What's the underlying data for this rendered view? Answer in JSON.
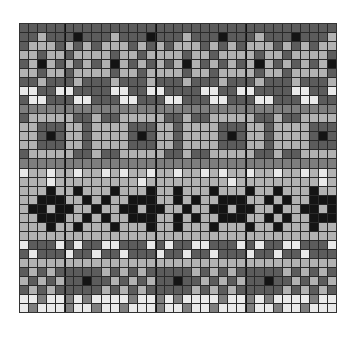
{
  "chart": {
    "title": "",
    "columns": 35,
    "rows": 32,
    "palette": {
      "D": "#5c5c5c",
      "M": "#7e7e7e",
      "L": "#b2b2b2",
      "W": "#e9e9e9",
      "B": "#141414"
    },
    "thick_line_every": 10,
    "thick_line_offset": 5,
    "pattern_rows": [
      {
        "period": "D",
        "offset": 0
      },
      {
        "period": "DDLDDDBD",
        "offset": 0
      },
      {
        "period": "DLLLDLDL",
        "offset": 0
      },
      {
        "period": "LLDLLDLL",
        "offset": 0
      },
      {
        "period": "DLBLDLDL",
        "offset": 0
      },
      {
        "period": "LLDLLDLL",
        "offset": 0
      },
      {
        "period": "DDLDDDLD",
        "offset": 0
      },
      {
        "period": "WWDDWWDDDD",
        "offset": 0
      },
      {
        "period": "DWWDDDWWDD",
        "offset": 0
      },
      {
        "period": "M",
        "offset": 0
      },
      {
        "period": "DLLLLLDDLD",
        "offset": 0
      },
      {
        "period": "LLDDDLLDLL",
        "offset": 0
      },
      {
        "period": "LLDBDLLDLL",
        "offset": 0
      },
      {
        "period": "LLDDDLLDLL",
        "offset": 0
      },
      {
        "period": "DLLLLLDDLD",
        "offset": 0
      },
      {
        "period": "M",
        "offset": 0
      },
      {
        "period": "WLLWLLWLLWL",
        "offset": 0
      },
      {
        "period": "LLLWLLLLLL",
        "offset": 0
      },
      {
        "period": "LLLBLLBLLLB",
        "offset": 0
      },
      {
        "period": "LLBBBLLBLB",
        "offset": 0
      },
      {
        "period": "LBBLBBLLBL",
        "offset": 0
      },
      {
        "period": "LLBBBLLBLB",
        "offset": 0
      },
      {
        "period": "LLLBLLBLLLB",
        "offset": 0
      },
      {
        "period": "L",
        "offset": 0
      },
      {
        "period": "WDDDWDWDDW",
        "offset": 0
      },
      {
        "period": "DWDDDWDDWD",
        "offset": 0
      },
      {
        "period": "LLLLLLLLLL",
        "offset": 0
      },
      {
        "period": "DLDLDDDDDL",
        "offset": 0
      },
      {
        "period": "LDLDLDDBDD",
        "offset": 0
      },
      {
        "period": "DLDLDDDDDL",
        "offset": 0
      },
      {
        "period": "WWMWWMWMWW",
        "offset": 0
      },
      {
        "period": "WMWWWMWWMW",
        "offset": 0
      }
    ]
  }
}
